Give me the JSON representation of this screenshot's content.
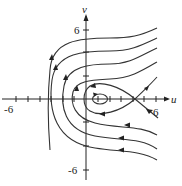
{
  "figure": {
    "type": "phase-portrait",
    "axes": {
      "x_label": "u",
      "y_label": "v",
      "x_tick_labels": {
        "neg": "-6",
        "pos": "6"
      },
      "y_tick_labels": {
        "pos": "6",
        "neg": "-6"
      },
      "x_range": [
        -7,
        7
      ],
      "y_range": [
        -7,
        7
      ]
    },
    "features": {
      "center": {
        "u": 1,
        "v": 0,
        "kind": "closed orbit (center)"
      },
      "saddle": {
        "u": 4,
        "v": 0,
        "kind": "saddle point"
      }
    },
    "trajectory_count": 9,
    "colors": {
      "ink": "#222222",
      "background": "#ffffff"
    }
  }
}
